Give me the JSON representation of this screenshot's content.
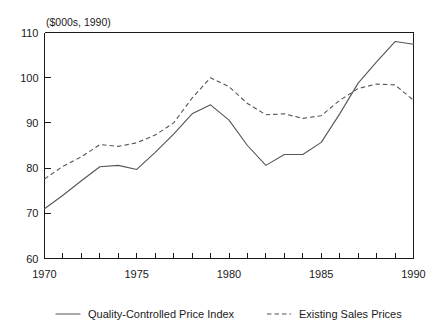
{
  "chart_data": {
    "type": "line",
    "title": "($000s, 1990)",
    "subtitle": "",
    "xlabel": "",
    "ylabel": "",
    "xlim": [
      1970,
      1990
    ],
    "ylim": [
      60,
      110
    ],
    "yticks": [
      60,
      70,
      80,
      90,
      100,
      110
    ],
    "ytick_labels": [
      "60",
      "70",
      "80",
      "90",
      "100",
      "110"
    ],
    "xticks": [
      1970,
      1975,
      1980,
      1985,
      1990
    ],
    "xtick_labels": [
      "1970",
      "1975",
      "1980",
      "1985",
      "1990"
    ],
    "minor_xticks_every": 1,
    "grid": false,
    "legend_position": "bottom",
    "x": [
      1970,
      1971,
      1972,
      1973,
      1974,
      1975,
      1976,
      1977,
      1978,
      1979,
      1980,
      1981,
      1982,
      1983,
      1984,
      1985,
      1986,
      1987,
      1988,
      1989,
      1990
    ],
    "series": [
      {
        "name": "Quality-Controlled Price Index",
        "style": "solid",
        "color": "#555555",
        "values": [
          71.0,
          74.0,
          77.2,
          80.3,
          80.6,
          79.7,
          83.5,
          87.5,
          92.0,
          94.0,
          90.6,
          85.0,
          80.6,
          83.0,
          83.0,
          85.7,
          92.0,
          98.8,
          103.5,
          108.0,
          107.4
        ]
      },
      {
        "name": "Existing Sales Prices",
        "style": "dashed",
        "color": "#555555",
        "values": [
          77.6,
          80.4,
          82.5,
          85.2,
          84.8,
          85.6,
          87.3,
          90.0,
          95.5,
          100.0,
          98.0,
          94.3,
          91.8,
          92.0,
          91.0,
          91.6,
          95.0,
          97.6,
          98.6,
          98.4,
          95.0
        ]
      }
    ]
  },
  "axis": {
    "unit_title": "($000s, 1990)"
  },
  "legend": {
    "items": [
      {
        "label": "Quality-Controlled Price Index",
        "style": "solid"
      },
      {
        "label": "Existing Sales Prices",
        "style": "dashed"
      }
    ]
  }
}
